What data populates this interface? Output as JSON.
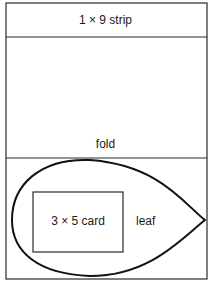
{
  "diagram": {
    "strip_label": "1 × 9 strip",
    "fold_label": "fold",
    "card_label": "3 × 5 card",
    "leaf_label": "leaf"
  },
  "colors": {
    "line": "#1a1a1a",
    "background": "#ffffff"
  }
}
